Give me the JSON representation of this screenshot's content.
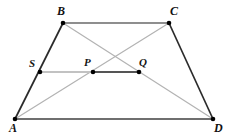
{
  "figure": {
    "kind": "geometry-diagram",
    "shape": "trapezoid",
    "background_color": "#ffffff",
    "width": 232,
    "height": 137
  },
  "colors": {
    "side_dark": "#2b2b2b",
    "base_gray": "#6f6f6f",
    "diagonal_light": "#b3b3b3",
    "segment_light": "#c2c2c2",
    "segment_dark": "#555555",
    "dot": "#000000",
    "label": "#111111"
  },
  "points": {
    "A": {
      "label": "A",
      "x": 15,
      "y": 119,
      "label_x": 9,
      "label_y": 122,
      "dot": true
    },
    "B": {
      "label": "B",
      "x": 63,
      "y": 23,
      "label_x": 57,
      "label_y": 5,
      "dot": true
    },
    "C": {
      "label": "C",
      "x": 169,
      "y": 23,
      "label_x": 170,
      "label_y": 5,
      "dot": true
    },
    "D": {
      "label": "D",
      "x": 213,
      "y": 119,
      "label_x": 214,
      "label_y": 122,
      "dot": true
    },
    "S": {
      "label": "S",
      "x": 40,
      "y": 72,
      "label_x": 29,
      "label_y": 58,
      "dot": true
    },
    "P": {
      "label": "P",
      "x": 93,
      "y": 72,
      "label_x": 84,
      "label_y": 57,
      "dot": true
    },
    "Q": {
      "label": "Q",
      "x": 139,
      "y": 72,
      "label_x": 139,
      "label_y": 57,
      "dot": true
    }
  },
  "segments": [
    {
      "name": "side-AB",
      "from": "A",
      "to": "B",
      "x1": 15,
      "y1": 119,
      "x2": 63,
      "y2": 23,
      "color": "#2b2b2b",
      "width": 1.7
    },
    {
      "name": "side-BC",
      "from": "B",
      "to": "C",
      "x1": 63,
      "y1": 23,
      "x2": 169,
      "y2": 23,
      "color": "#6a6a6a",
      "width": 1.7
    },
    {
      "name": "side-CD",
      "from": "C",
      "to": "D",
      "x1": 169,
      "y1": 23,
      "x2": 213,
      "y2": 119,
      "color": "#2b2b2b",
      "width": 1.7
    },
    {
      "name": "side-AD",
      "from": "A",
      "to": "D",
      "x1": 15,
      "y1": 119,
      "x2": 213,
      "y2": 119,
      "color": "#6f6f6f",
      "width": 1.8
    },
    {
      "name": "diagonal-AC",
      "from": "A",
      "to": "C",
      "x1": 15,
      "y1": 119,
      "x2": 169,
      "y2": 23,
      "color": "#b3b3b3",
      "width": 1.2
    },
    {
      "name": "diagonal-BD",
      "from": "B",
      "to": "D",
      "x1": 63,
      "y1": 23,
      "x2": 213,
      "y2": 119,
      "color": "#b3b3b3",
      "width": 1.2
    },
    {
      "name": "segment-SP",
      "from": "S",
      "to": "P",
      "x1": 40,
      "y1": 72,
      "x2": 93,
      "y2": 72,
      "color": "#c2c2c2",
      "width": 1.8
    },
    {
      "name": "segment-PQ",
      "from": "P",
      "to": "Q",
      "x1": 93,
      "y1": 72,
      "x2": 139,
      "y2": 72,
      "color": "#555555",
      "width": 1.8
    }
  ],
  "vertex_labels": [
    "A",
    "B",
    "C",
    "D"
  ],
  "interior_labels": [
    "S",
    "P",
    "Q"
  ]
}
